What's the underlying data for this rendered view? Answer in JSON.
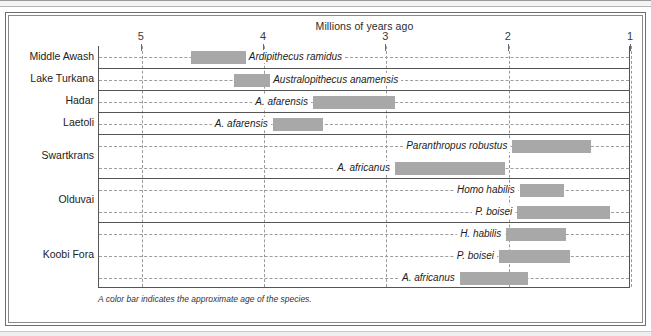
{
  "figure": {
    "axis_title": "Millions of years ago",
    "caption": "A color bar indicates the approximate age of the species.",
    "bar_color": "#a8a8a8",
    "axis_color": "#555555",
    "grid_color": "#9a9a9a"
  },
  "axis": {
    "label": "Millions of years ago",
    "ticks": [
      {
        "value": 5,
        "label": "5"
      },
      {
        "value": 4,
        "label": "4"
      },
      {
        "value": 3,
        "label": "3"
      },
      {
        "value": 2,
        "label": "2"
      },
      {
        "value": 1,
        "label": "1"
      }
    ],
    "min": 1,
    "max": 5.35,
    "direction": "decreasing-left-to-right"
  },
  "sites": [
    {
      "name": "Middle Awash"
    },
    {
      "name": "Lake Turkana"
    },
    {
      "name": "Hadar"
    },
    {
      "name": "Laetoli"
    },
    {
      "name": "Swartkrans"
    },
    {
      "name": "Olduvai"
    },
    {
      "name": "Koobi Fora"
    }
  ],
  "chart_data": {
    "type": "bar",
    "orientation": "horizontal-range",
    "title": "Millions of years ago",
    "xlabel": "Millions of years ago",
    "ylabel": "",
    "xlim": [
      5.35,
      1.0
    ],
    "grid": true,
    "legend": "none",
    "annotation": "A color bar indicates the approximate age of the species.",
    "categories": [
      "Middle Awash",
      "Lake Turkana",
      "Hadar",
      "Laetoli",
      "Swartkrans",
      "Olduvai",
      "Koobi Fora"
    ],
    "rows": [
      {
        "site": "Middle Awash",
        "species": "Ardipithecus ramidus",
        "start_mya": 4.6,
        "end_mya": 4.15,
        "label_side": "right"
      },
      {
        "site": "Lake Turkana",
        "species": "Australopithecus anamensis",
        "start_mya": 4.25,
        "end_mya": 3.95,
        "label_side": "right"
      },
      {
        "site": "Hadar",
        "species": "A. afarensis",
        "start_mya": 3.6,
        "end_mya": 2.93,
        "label_side": "left"
      },
      {
        "site": "Laetoli",
        "species": "A. afarensis",
        "start_mya": 3.93,
        "end_mya": 3.52,
        "label_side": "left"
      },
      {
        "site": "Swartkrans",
        "species": "Paranthropus robustus",
        "start_mya": 1.97,
        "end_mya": 1.33,
        "label_side": "left"
      },
      {
        "site": "Swartkrans",
        "species": "A. africanus",
        "start_mya": 2.93,
        "end_mya": 2.03,
        "label_side": "left"
      },
      {
        "site": "Olduvai",
        "species": "Homo habilis",
        "start_mya": 1.91,
        "end_mya": 1.55,
        "label_side": "left"
      },
      {
        "site": "Olduvai",
        "species": "P. boisei",
        "start_mya": 1.93,
        "end_mya": 1.17,
        "label_side": "left"
      },
      {
        "site": "Koobi Fora",
        "species": "H. habilis",
        "start_mya": 2.02,
        "end_mya": 1.53,
        "label_side": "left"
      },
      {
        "site": "Koobi Fora",
        "species": "P. boisei",
        "start_mya": 2.08,
        "end_mya": 1.5,
        "label_side": "left"
      },
      {
        "site": "Koobi Fora",
        "species": "A. africanus",
        "start_mya": 2.4,
        "end_mya": 1.84,
        "label_side": "left"
      }
    ]
  }
}
